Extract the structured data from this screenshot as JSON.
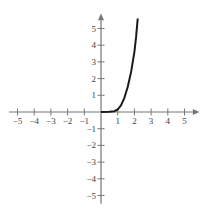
{
  "chart_data": {
    "type": "line",
    "title": "",
    "xlabel": "",
    "ylabel": "",
    "xlim": [
      -5.5,
      5.8
    ],
    "ylim": [
      -5.5,
      5.8
    ],
    "x_ticks": [
      "-5",
      "-4",
      "-3",
      "-2",
      "-1",
      "1",
      "2",
      "3",
      "4",
      "5"
    ],
    "y_ticks": [
      "5",
      "4",
      "3",
      "2",
      "1",
      "-1",
      "-2",
      "-3",
      "-4",
      "-5"
    ],
    "grid": false,
    "legend": null,
    "series": [
      {
        "name": "curve",
        "x": [
          0,
          0.5,
          0.8,
          1.0,
          1.2,
          1.4,
          1.6,
          1.8,
          2.0,
          2.1,
          2.2
        ],
        "values": [
          0,
          0.01,
          0.05,
          0.15,
          0.4,
          0.85,
          1.5,
          2.4,
          3.6,
          4.5,
          5.6
        ]
      }
    ],
    "colors": {
      "axis": "#777777",
      "curve": "#1a1a1a"
    }
  }
}
